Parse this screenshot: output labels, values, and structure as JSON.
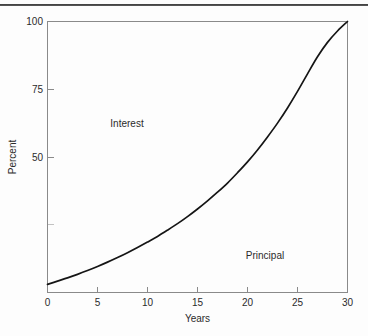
{
  "page": {
    "top_rule": "horizontal-rule"
  },
  "chart_data": {
    "type": "line",
    "title": "",
    "subtitle": "",
    "xlabel": "Years",
    "ylabel": "Percent",
    "xlim": [
      0,
      30
    ],
    "ylim": [
      0,
      100
    ],
    "grid": false,
    "legend": "none",
    "x_ticks": [
      {
        "value": 0,
        "label": "0"
      },
      {
        "value": 5,
        "label": "5"
      },
      {
        "value": 10,
        "label": "10"
      },
      {
        "value": 15,
        "label": "15"
      },
      {
        "value": 20,
        "label": "20"
      },
      {
        "value": 25,
        "label": "25"
      },
      {
        "value": 30,
        "label": "30"
      }
    ],
    "y_ticks": [
      {
        "value": 0,
        "label": ""
      },
      {
        "value": 25,
        "label": ""
      },
      {
        "value": 50,
        "label": "50"
      },
      {
        "value": 75,
        "label": "75"
      },
      {
        "value": 100,
        "label": "100"
      }
    ],
    "series": [
      {
        "name": "Interest share of payment",
        "color": "#151515",
        "x": [
          0,
          1,
          2,
          3,
          4,
          5,
          6,
          7,
          8,
          9,
          10,
          11,
          12,
          13,
          14,
          15,
          16,
          17,
          18,
          19,
          20,
          21,
          22,
          23,
          24,
          25,
          26,
          27,
          28,
          29,
          30
        ],
        "values": [
          3,
          4.2,
          5.4,
          6.7,
          8.1,
          9.6,
          11.2,
          12.9,
          14.7,
          16.6,
          18.6,
          20.7,
          23.0,
          25.4,
          28.0,
          30.8,
          33.8,
          37.0,
          40.4,
          44.2,
          48.2,
          52.6,
          57.4,
          62.5,
          68.1,
          74.2,
          80.7,
          87.0,
          92.3,
          96.5,
          100
        ]
      }
    ],
    "annotations": [
      {
        "text": "Interest",
        "x": 9,
        "y": 62
      },
      {
        "text": "Principal",
        "x": 22,
        "y": 17
      }
    ]
  }
}
